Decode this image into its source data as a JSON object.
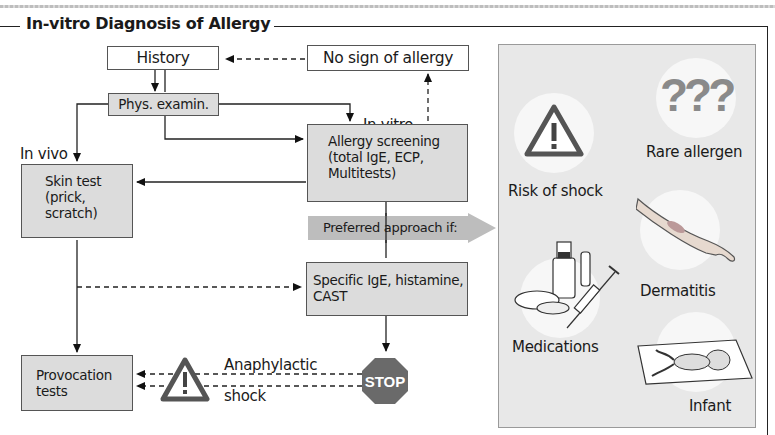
{
  "title": "In-vitro Diagnosis of Allergy",
  "flow": {
    "history": "History",
    "no_sign": "No sign of allergy",
    "phys_exam": "Phys. examin.",
    "in_vitro_label": "In vitro",
    "in_vivo_label": "In vivo",
    "allergy_screening": [
      "Allergy screening",
      "(total IgE, ECP,",
      "Multitests)"
    ],
    "skin_test": [
      "Skin test",
      "(prick,",
      "scratch)"
    ],
    "preferred": "Preferred approach if:",
    "specific_ige": [
      "Specific IgE, histamine,",
      "CAST"
    ],
    "provocation": [
      "Provocation",
      "tests"
    ],
    "anaphylactic": "Anaphylactic",
    "shock": "shock",
    "stop_sign": "STOP"
  },
  "panel": {
    "items": [
      {
        "label": "Risk of shock",
        "icon": "warning-triangle-icon"
      },
      {
        "label": "Rare allergen",
        "icon": "question-marks-icon"
      },
      {
        "label": "Dermatitis",
        "icon": "arm-icon"
      },
      {
        "label": "Medications",
        "icon": "medication-syringe-icon"
      },
      {
        "label": "Infant",
        "icon": "infant-icon"
      }
    ],
    "qmarks": "???"
  },
  "colors": {
    "box_grey": "#dcdcdc",
    "panel_bg": "#e8e8e8",
    "arrow_grey": "#bdbdbd",
    "stop_red": "#6e6e6e"
  }
}
